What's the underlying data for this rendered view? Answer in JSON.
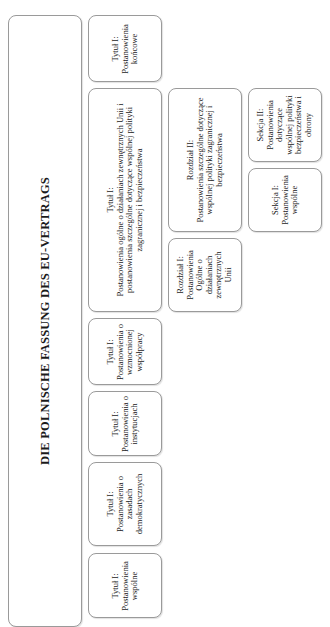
{
  "diagram": {
    "title": "DIE POLNISCHE FASSUNG DES EU-VERTRAGS",
    "titles": [
      {
        "heading": "Tytuł I:",
        "body": "Postanowienia końcowe"
      },
      {
        "heading": "Tytuł I:",
        "body": "Postanowienia ogólne o działaniach zewnętrznych Unii i postanowienia szczególne dotyczące wspólnej polityki zagranicznej i bezpieczeństwa"
      },
      {
        "heading": "Tytuł I:",
        "body": "Postanowienia o wzmocnionej współpracy"
      },
      {
        "heading": "Tytuł I:",
        "body": "Postanowienia o instytucjach"
      },
      {
        "heading": "Tytuł I:",
        "body": "Postanowienia o zasadach demokratycznych"
      },
      {
        "heading": "Tytuł I:",
        "body": "Postanowienia wspólne"
      }
    ],
    "chapters": [
      {
        "heading": "Rozdział II:",
        "body": "Postanowienia szczególne dotyczące wspólnej polityki zagranicznej i bezpieczeństwa"
      },
      {
        "heading": "Rozdział I:",
        "body": "Postanowienia Ogólne o działaniach zewnętrznych Unii"
      }
    ],
    "sections": [
      {
        "heading": "Sekcja II:",
        "body": "Postanowienia dotyczące wspólnej polityki bezpieczeństwa i obrony"
      },
      {
        "heading": "Sekcja I:",
        "body": "Postanowienia wspólne"
      }
    ],
    "colors": {
      "border": "#9a9a9a",
      "text": "#1a1a1a",
      "background": "#ffffff"
    }
  }
}
